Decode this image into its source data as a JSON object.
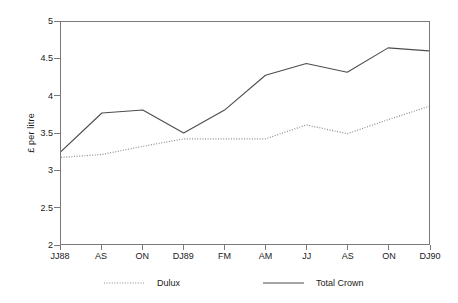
{
  "chart_data": {
    "type": "line",
    "title": "",
    "subtitle": "",
    "xlabel": "",
    "ylabel": "£ per litre",
    "categories": [
      "JJ88",
      "AS",
      "ON",
      "DJ89",
      "FM",
      "AM",
      "JJ",
      "AS",
      "ON",
      "DJ90"
    ],
    "ylim": [
      2,
      5
    ],
    "yticks": [
      2,
      2.5,
      3,
      3.5,
      4,
      4.5,
      5
    ],
    "ytick_labels": [
      "2",
      "2.5",
      "3",
      "3.5",
      "4",
      "4.5",
      "5"
    ],
    "grid": false,
    "legend_position": "bottom",
    "series": [
      {
        "name": "Dulux",
        "style": "dotted",
        "color": "#8c8c8c",
        "values": [
          3.17,
          3.21,
          3.32,
          3.42,
          3.42,
          3.42,
          3.61,
          3.49,
          3.68,
          3.86
        ]
      },
      {
        "name": "Total Crown",
        "style": "solid",
        "color": "#4d4d4d",
        "values": [
          3.25,
          3.77,
          3.81,
          3.5,
          3.81,
          4.28,
          4.44,
          4.32,
          4.65,
          4.61
        ]
      }
    ]
  },
  "axes": {
    "y_title": "£ per litre",
    "frame_color": "#7a7a7a"
  },
  "legend": {
    "items": [
      {
        "label": "Dulux"
      },
      {
        "label": "Total Crown"
      }
    ]
  }
}
